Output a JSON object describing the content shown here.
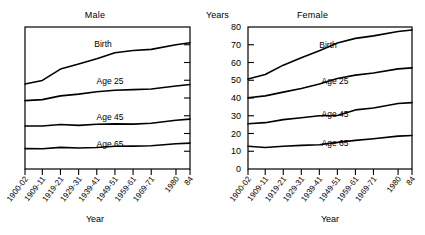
{
  "figure": {
    "xlabel": "Year",
    "ylabel": "Years"
  },
  "panels": {
    "male": {
      "title": "Male"
    },
    "female": {
      "title": "Female"
    }
  },
  "series_labels": {
    "birth": "Birth",
    "age25": "Age 25",
    "age45": "Age 45",
    "age65": "Age 65"
  },
  "axis": {
    "x_ticks": [
      "1900-02",
      "1909-11",
      "1919-21",
      "1929-31",
      "1939-41",
      "1949-51",
      "1959-61",
      "1969-71",
      "1980",
      "84"
    ],
    "y_ticks": [
      "0",
      "10",
      "20",
      "30",
      "40",
      "50",
      "60",
      "70",
      "80"
    ]
  },
  "chart_data": {
    "type": "line",
    "xlabel": "Year",
    "ylabel": "Years",
    "ylim": [
      0,
      80
    ],
    "ytick_values": [
      0,
      10,
      20,
      30,
      40,
      50,
      60,
      70,
      80
    ],
    "grid": false,
    "legend": "inline-labels",
    "x": [
      "1900-02",
      "1909-11",
      "1919-21",
      "1929-31",
      "1939-41",
      "1949-51",
      "1959-61",
      "1969-71",
      "1980",
      "84"
    ],
    "panels": [
      {
        "name": "Male",
        "y_axis_labeled": false,
        "series": [
          {
            "name": "Birth",
            "values": [
              47.9,
              49.9,
              56.3,
              59.1,
              62.1,
              65.5,
              66.8,
              67.4,
              70.0,
              71.1
            ]
          },
          {
            "name": "Age 25",
            "values": [
              38.5,
              39.1,
              41.2,
              42.2,
              43.5,
              44.4,
              44.7,
              45.1,
              46.8,
              47.6
            ]
          },
          {
            "name": "Age 45",
            "values": [
              24.2,
              24.2,
              25.1,
              24.6,
              25.2,
              25.4,
              25.3,
              25.8,
              27.5,
              28.1
            ]
          },
          {
            "name": "Age 65",
            "values": [
              11.5,
              11.4,
              12.2,
              11.8,
              12.1,
              12.8,
              12.9,
              13.1,
              14.2,
              14.6
            ]
          }
        ]
      },
      {
        "name": "Female",
        "y_axis_labeled": true,
        "series": [
          {
            "name": "Birth",
            "values": [
              50.7,
              53.2,
              58.5,
              62.7,
              66.6,
              71.0,
              73.6,
              75.0,
              77.5,
              78.3
            ]
          },
          {
            "name": "Age 25",
            "values": [
              40.1,
              41.2,
              43.3,
              45.3,
              47.9,
              51.0,
              52.9,
              54.1,
              56.4,
              57.0
            ]
          },
          {
            "name": "Age 45",
            "values": [
              25.5,
              26.1,
              27.8,
              28.9,
              30.0,
              30.1,
              33.3,
              34.4,
              36.9,
              37.4
            ]
          },
          {
            "name": "Age 65",
            "values": [
              12.8,
              12.1,
              12.8,
              13.3,
              13.7,
              15.0,
              16.1,
              17.0,
              18.5,
              18.9
            ]
          }
        ]
      }
    ]
  }
}
